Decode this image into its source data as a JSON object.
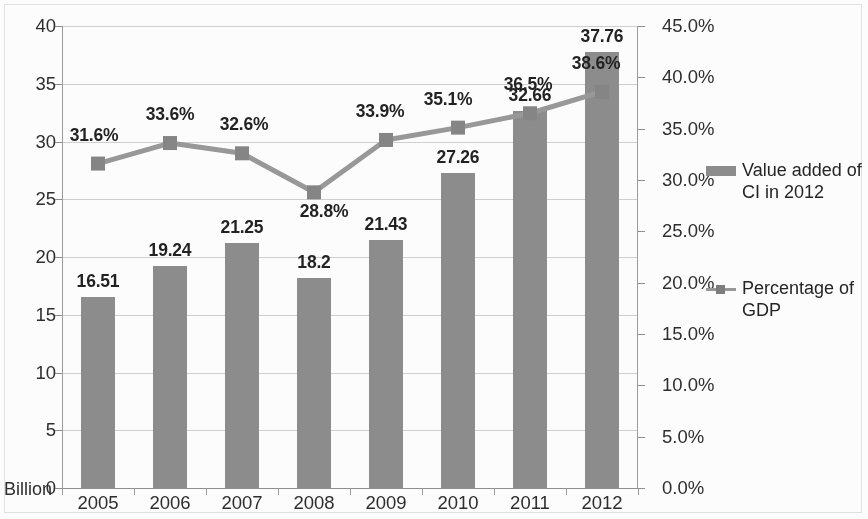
{
  "chart_data": {
    "type": "bar",
    "title": "",
    "subtitle": "",
    "xlabel": "",
    "ylabel": "Billion",
    "y2label": "",
    "categories": [
      "2005",
      "2006",
      "2007",
      "2008",
      "2009",
      "2010",
      "2011",
      "2012"
    ],
    "series": [
      {
        "name": "Value added of CI in 2012",
        "type": "bar",
        "axis": "left",
        "unit": "Billion",
        "color": "#8b8b8b",
        "values": [
          16.51,
          19.24,
          21.25,
          18.2,
          21.43,
          27.26,
          32.66,
          37.76
        ],
        "labels": [
          "16.51",
          "19.24",
          "21.25",
          "18.2",
          "21.43",
          "27.26",
          "32.66",
          "37.76"
        ]
      },
      {
        "name": "Percentage of GDP",
        "type": "line",
        "axis": "right",
        "unit": "%",
        "color": "#979797",
        "values": [
          31.6,
          33.6,
          32.6,
          28.8,
          33.9,
          35.1,
          36.5,
          38.6
        ],
        "labels": [
          "31.6%",
          "33.6%",
          "32.6%",
          "28.8%",
          "33.9%",
          "35.1%",
          "36.5%",
          "38.6%"
        ]
      }
    ],
    "y_left_ticks": [
      "0",
      "5",
      "10",
      "15",
      "20",
      "25",
      "30",
      "35",
      "40"
    ],
    "y_left_values": [
      0,
      5,
      10,
      15,
      20,
      25,
      30,
      35,
      40
    ],
    "ylim": [
      0,
      40
    ],
    "y_right_ticks": [
      "0.0%",
      "5.0%",
      "10.0%",
      "15.0%",
      "20.0%",
      "25.0%",
      "30.0%",
      "35.0%",
      "40.0%",
      "45.0%"
    ],
    "y_right_values": [
      0,
      5,
      10,
      15,
      20,
      25,
      30,
      35,
      40,
      45
    ],
    "y2lim": [
      0,
      45
    ],
    "grid": true,
    "legend_position": "right",
    "legend": [
      {
        "label_line1": "Value added of",
        "label_line2": "CI in 2012",
        "marker": "bar-swatch"
      },
      {
        "label_line1": "Percentage of",
        "label_line2": "GDP",
        "marker": "line-swatch"
      }
    ]
  },
  "axis_unit_note": "Billion"
}
